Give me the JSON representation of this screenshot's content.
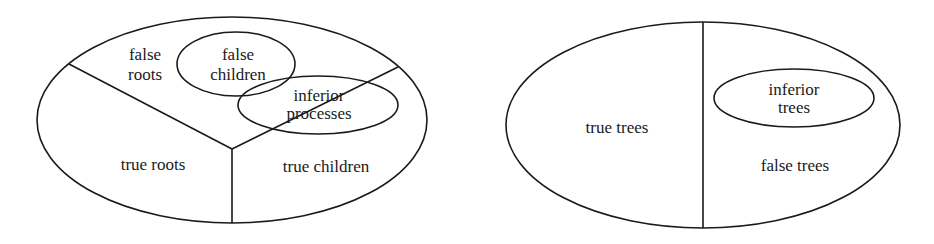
{
  "diagrams": [
    {
      "name": "processes",
      "regions": {
        "false_roots": [
          "false",
          "roots"
        ],
        "false_children": [
          "false",
          "children"
        ],
        "inferior_processes": [
          "inferior",
          "processes"
        ],
        "true_roots": "true roots",
        "true_children": "true children"
      }
    },
    {
      "name": "trees",
      "regions": {
        "true_trees": "true trees",
        "inferior_trees": [
          "inferior",
          "trees"
        ],
        "false_trees": "false trees"
      }
    }
  ],
  "colors": {
    "stroke": "#1a1a1a",
    "background": "#ffffff"
  }
}
